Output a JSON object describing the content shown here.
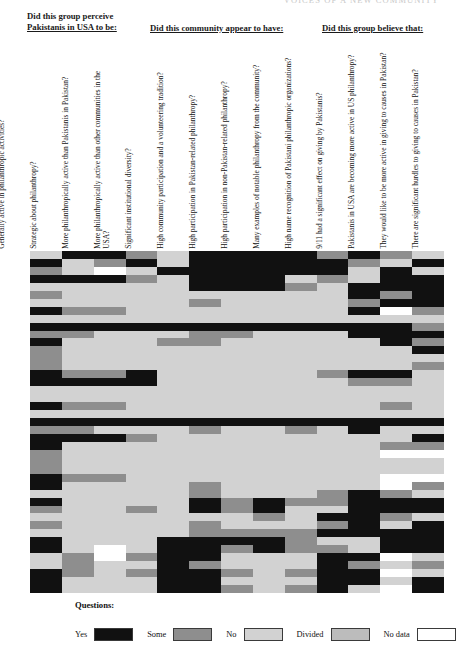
{
  "page_header": "VOICES OF A NEW COMMUNITY",
  "group_headings": [
    {
      "line1": "Did this group perceive",
      "line2": "Pakistanis in USA to be:"
    },
    {
      "line1": "Did this community appear to have:",
      "line2": ""
    },
    {
      "line1": "Did this group believe that:",
      "line2": ""
    }
  ],
  "columns": [
    "Generally active in philanthropic activities?",
    "Strategic about philanthropy?",
    "More philanthropically active than Pakistanis in Pakistan?",
    "More philanthropically active than other communities in the USA?",
    "Significant institutional diversity?",
    "High community participation and a volunteering tradition?",
    "High participation in Pakistan-related philanthropy?",
    "High participation in non-Pakistan-related philanthropy?",
    "Many examples of notable philanthropy from the community?",
    "High name recognition of Pakistani philanthropic organizations?",
    "9/11 had a significant effect on giving by Pakistanis?",
    "Pakistanis in USA are becoming more active in US philanthropy?",
    "They would like to be more active in giving to causes in Pakistan?",
    "There are significant hurdles to giving to causes in Pakistan?"
  ],
  "legend": {
    "title": "Questions:",
    "items": [
      {
        "label": "Yes",
        "value": "yes",
        "color": "#111111"
      },
      {
        "label": "Some",
        "value": "some",
        "color": "#8e8e8e"
      },
      {
        "label": "No",
        "value": "no",
        "color": "#d2d2d2"
      },
      {
        "label": "Divided",
        "value": "divided",
        "color": "#bcbcbc"
      },
      {
        "label": "No data",
        "value": "nodata",
        "color": "#ffffff"
      }
    ]
  },
  "chart_data": {
    "type": "heatmap",
    "title": "",
    "xlabel": "",
    "ylabel": "",
    "grid": false,
    "legend_position": "bottom",
    "categories": [
      "Generally active in philanthropic activities?",
      "Strategic about philanthropy?",
      "More philanthropically active than Pakistanis in Pakistan?",
      "More philanthropically active than other communities in the USA?",
      "Significant institutional diversity?",
      "High community participation and a volunteering tradition?",
      "High participation in Pakistan-related philanthropy?",
      "High participation in non-Pakistan-related philanthropy?",
      "Many examples of notable philanthropy from the community?",
      "High name recognition of Pakistani philanthropic organizations?",
      "9/11 had a significant effect on giving by Pakistanis?",
      "Pakistanis in USA are becoming more active in US philanthropy?",
      "They would like to be more active in giving to causes in Pakistan?"
    ],
    "value_levels": [
      "yes",
      "some",
      "no",
      "divided",
      "nodata"
    ],
    "rows": [
      [
        "no",
        "yes",
        "yes",
        "some",
        "no",
        "yes",
        "yes",
        "yes",
        "yes",
        "some",
        "yes",
        "some",
        "no"
      ],
      [
        "yes",
        "no",
        "some",
        "yes",
        "no",
        "yes",
        "yes",
        "yes",
        "yes",
        "yes",
        "some",
        "no",
        "yes"
      ],
      [
        "some",
        "no",
        "nodata",
        "no",
        "yes",
        "yes",
        "yes",
        "yes",
        "yes",
        "yes",
        "no",
        "yes",
        "no"
      ],
      [
        "yes",
        "yes",
        "yes",
        "some",
        "no",
        "yes",
        "yes",
        "yes",
        "no",
        "some",
        "no",
        "yes",
        "yes"
      ],
      [
        "no",
        "no",
        "no",
        "no",
        "no",
        "yes",
        "yes",
        "yes",
        "some",
        "no",
        "yes",
        "yes",
        "yes"
      ],
      [
        "some",
        "no",
        "no",
        "no",
        "no",
        "no",
        "no",
        "no",
        "no",
        "no",
        "yes",
        "some",
        "yes"
      ],
      [
        "no",
        "no",
        "no",
        "no",
        "no",
        "some",
        "no",
        "no",
        "no",
        "no",
        "some",
        "yes",
        "yes"
      ],
      [
        "yes",
        "some",
        "some",
        "no",
        "no",
        "no",
        "no",
        "no",
        "no",
        "no",
        "yes",
        "nodata",
        "some"
      ],
      [
        "no",
        "no",
        "no",
        "no",
        "no",
        "no",
        "no",
        "no",
        "no",
        "no",
        "no",
        "no",
        "no"
      ],
      [
        "yes",
        "yes",
        "yes",
        "yes",
        "yes",
        "yes",
        "yes",
        "yes",
        "yes",
        "yes",
        "yes",
        "yes",
        "some"
      ],
      [
        "some",
        "some",
        "no",
        "no",
        "no",
        "some",
        "some",
        "no",
        "no",
        "no",
        "yes",
        "yes",
        "yes"
      ],
      [
        "yes",
        "no",
        "no",
        "no",
        "some",
        "some",
        "no",
        "no",
        "no",
        "no",
        "no",
        "yes",
        "some"
      ],
      [
        "some",
        "no",
        "no",
        "no",
        "no",
        "no",
        "no",
        "no",
        "no",
        "no",
        "no",
        "no",
        "yes"
      ],
      [
        "some",
        "no",
        "no",
        "no",
        "no",
        "no",
        "no",
        "no",
        "no",
        "no",
        "no",
        "no",
        "no"
      ],
      [
        "some",
        "no",
        "no",
        "no",
        "no",
        "no",
        "no",
        "no",
        "no",
        "no",
        "no",
        "no",
        "some"
      ],
      [
        "yes",
        "some",
        "some",
        "yes",
        "no",
        "no",
        "no",
        "no",
        "no",
        "some",
        "yes",
        "yes",
        "no"
      ],
      [
        "yes",
        "yes",
        "yes",
        "yes",
        "no",
        "no",
        "no",
        "no",
        "no",
        "no",
        "some",
        "some",
        "no"
      ],
      [
        "no",
        "no",
        "no",
        "no",
        "no",
        "no",
        "no",
        "no",
        "no",
        "no",
        "no",
        "no",
        "no"
      ],
      [
        "no",
        "no",
        "no",
        "no",
        "no",
        "no",
        "no",
        "no",
        "no",
        "no",
        "no",
        "no",
        "no"
      ],
      [
        "yes",
        "some",
        "some",
        "no",
        "no",
        "no",
        "no",
        "no",
        "no",
        "no",
        "no",
        "some",
        "no"
      ],
      [
        "no",
        "no",
        "no",
        "no",
        "no",
        "no",
        "no",
        "no",
        "no",
        "no",
        "no",
        "no",
        "no"
      ],
      [
        "yes",
        "yes",
        "yes",
        "yes",
        "yes",
        "yes",
        "yes",
        "yes",
        "yes",
        "yes",
        "yes",
        "yes",
        "yes"
      ],
      [
        "some",
        "some",
        "no",
        "no",
        "no",
        "some",
        "no",
        "no",
        "some",
        "no",
        "yes",
        "no",
        "no"
      ],
      [
        "yes",
        "yes",
        "yes",
        "some",
        "no",
        "no",
        "no",
        "no",
        "no",
        "no",
        "no",
        "no",
        "yes"
      ],
      [
        "yes",
        "no",
        "no",
        "no",
        "no",
        "no",
        "no",
        "no",
        "no",
        "no",
        "no",
        "some",
        "some"
      ],
      [
        "some",
        "no",
        "no",
        "no",
        "no",
        "no",
        "no",
        "no",
        "no",
        "no",
        "no",
        "nodata",
        "nodata"
      ],
      [
        "some",
        "no",
        "no",
        "no",
        "no",
        "no",
        "no",
        "no",
        "no",
        "no",
        "no",
        "no",
        "no"
      ],
      [
        "some",
        "no",
        "no",
        "no",
        "no",
        "no",
        "no",
        "no",
        "no",
        "no",
        "no",
        "no",
        "no"
      ],
      [
        "yes",
        "some",
        "some",
        "no",
        "no",
        "no",
        "no",
        "no",
        "no",
        "no",
        "no",
        "nodata",
        "nodata"
      ],
      [
        "yes",
        "no",
        "no",
        "no",
        "no",
        "some",
        "no",
        "no",
        "no",
        "no",
        "no",
        "nodata",
        "some"
      ],
      [
        "no",
        "no",
        "no",
        "no",
        "no",
        "some",
        "no",
        "no",
        "no",
        "some",
        "yes",
        "some",
        "no"
      ],
      [
        "yes",
        "no",
        "no",
        "no",
        "no",
        "yes",
        "some",
        "yes",
        "some",
        "some",
        "yes",
        "yes",
        "yes"
      ],
      [
        "some",
        "no",
        "no",
        "some",
        "no",
        "yes",
        "some",
        "yes",
        "no",
        "no",
        "yes",
        "yes",
        "yes"
      ],
      [
        "no",
        "no",
        "no",
        "no",
        "no",
        "no",
        "no",
        "some",
        "no",
        "yes",
        "yes",
        "some",
        "no"
      ],
      [
        "some",
        "no",
        "no",
        "no",
        "no",
        "some",
        "no",
        "no",
        "no",
        "some",
        "yes",
        "no",
        "yes"
      ],
      [
        "no",
        "no",
        "no",
        "no",
        "no",
        "some",
        "some",
        "some",
        "some",
        "yes",
        "yes",
        "yes",
        "yes"
      ],
      [
        "yes",
        "no",
        "no",
        "no",
        "yes",
        "yes",
        "yes",
        "yes",
        "some",
        "no",
        "no",
        "yes",
        "yes"
      ],
      [
        "yes",
        "no",
        "nodata",
        "no",
        "yes",
        "yes",
        "some",
        "yes",
        "some",
        "some",
        "no",
        "yes",
        "yes"
      ],
      [
        "no",
        "some",
        "nodata",
        "some",
        "yes",
        "yes",
        "no",
        "no",
        "no",
        "yes",
        "yes",
        "nodata",
        "no"
      ],
      [
        "no",
        "some",
        "no",
        "no",
        "yes",
        "some",
        "no",
        "no",
        "no",
        "yes",
        "some",
        "no",
        "some"
      ],
      [
        "yes",
        "some",
        "no",
        "some",
        "yes",
        "yes",
        "some",
        "no",
        "some",
        "yes",
        "yes",
        "nodata",
        "no"
      ],
      [
        "yes",
        "no",
        "no",
        "no",
        "yes",
        "yes",
        "no",
        "no",
        "no",
        "yes",
        "yes",
        "no",
        "yes"
      ],
      [
        "yes",
        "no",
        "no",
        "no",
        "yes",
        "yes",
        "some",
        "no",
        "some",
        "yes",
        "no",
        "nodata",
        "yes"
      ]
    ]
  }
}
